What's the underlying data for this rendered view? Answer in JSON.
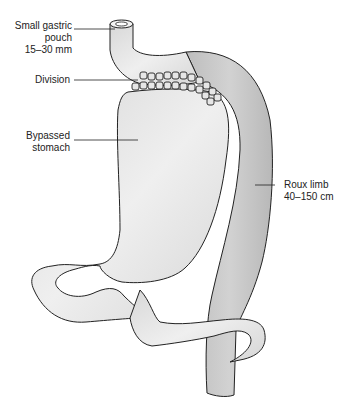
{
  "diagram": {
    "labels": {
      "pouch_line1": "Small gastric",
      "pouch_line2": "pouch",
      "pouch_line3": "15–30 mm",
      "division": "Division",
      "bypassed_line1": "Bypassed",
      "bypassed_line2": "stomach",
      "roux_line1": "Roux limb",
      "roux_line2": "40–150 cm"
    },
    "colors": {
      "stomach_fill": "#e2e2e2",
      "roux_fill": "#c8c8c8",
      "outline": "#222222",
      "background": "#ffffff"
    }
  }
}
